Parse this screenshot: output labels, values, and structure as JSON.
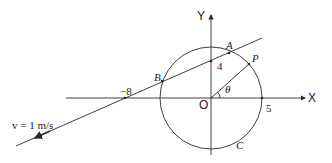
{
  "figure": {
    "axes": {
      "x_label": "X",
      "y_label": "Y",
      "origin_label": "O"
    },
    "circle": {
      "label": "C",
      "radius_mark": "5",
      "center": "O"
    },
    "line": {
      "x_intercept_label": "−8",
      "y_intercept_label": "4",
      "velocity_label": "v = 1 m/s"
    },
    "points": {
      "A": "A",
      "B": "B",
      "P": "P"
    },
    "angle_label": "θ"
  },
  "colors": {
    "stroke": "#2a2a2a",
    "background": "#ffffff"
  }
}
